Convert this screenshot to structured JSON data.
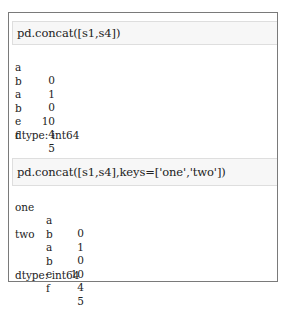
{
  "cells": [
    {
      "input": "pd.concat([s1,s4])",
      "output": {
        "rows": [
          {
            "index": "a",
            "value": "0"
          },
          {
            "index": "b",
            "value": "1"
          },
          {
            "index": "a",
            "value": "0"
          },
          {
            "index": "b",
            "value": "10"
          },
          {
            "index": "e",
            "value": "4"
          },
          {
            "index": "f",
            "value": "5"
          }
        ],
        "dtype": "dtype: int64"
      }
    },
    {
      "input": "pd.concat([s1,s4],keys=['one','two'])",
      "output": {
        "rows": [
          {
            "key": "one",
            "index": "a",
            "value": "0"
          },
          {
            "key": "",
            "index": "b",
            "value": "1"
          },
          {
            "key": "two",
            "index": "a",
            "value": "0"
          },
          {
            "key": "",
            "index": "b",
            "value": "10"
          },
          {
            "key": "",
            "index": "e",
            "value": "4"
          },
          {
            "key": "",
            "index": "f",
            "value": "5"
          }
        ],
        "dtype": "dtype: int64"
      }
    }
  ]
}
